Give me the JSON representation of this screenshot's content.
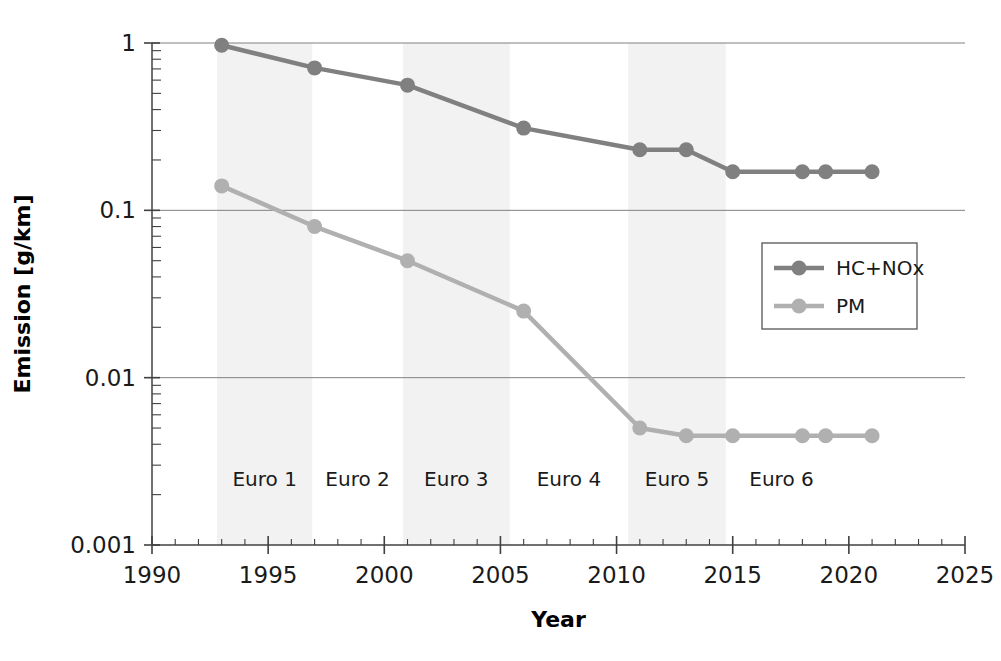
{
  "chart_data": {
    "type": "line",
    "title": "",
    "xlabel": "Year",
    "ylabel": "Emission [g/km]",
    "xlim": [
      1990,
      2025
    ],
    "ylim": [
      0.001,
      1
    ],
    "yscale": "log",
    "grid": true,
    "legend_position": "right",
    "x_ticks": [
      "1990",
      "1995",
      "2000",
      "2005",
      "2010",
      "2015",
      "2020",
      "2025"
    ],
    "x_tick_values": [
      1990,
      1995,
      2000,
      2005,
      2010,
      2015,
      2020,
      2025
    ],
    "y_ticks": [
      "1",
      "0.1",
      "0.01",
      "0.001"
    ],
    "y_tick_values": [
      1,
      0.1,
      0.01,
      0.001
    ],
    "series": [
      {
        "name": "HC+NOx",
        "color": "#808080",
        "x": [
          1993,
          1997,
          2001,
          2006,
          2011,
          2013,
          2015,
          2018,
          2019,
          2021
        ],
        "values": [
          0.97,
          0.71,
          0.56,
          0.31,
          0.23,
          0.23,
          0.17,
          0.17,
          0.17,
          0.17
        ]
      },
      {
        "name": "PM",
        "color": "#b0b0b0",
        "x": [
          1993,
          1997,
          2001,
          2006,
          2011,
          2013,
          2015,
          2018,
          2019,
          2021
        ],
        "values": [
          0.14,
          0.08,
          0.05,
          0.025,
          0.005,
          0.0045,
          0.0045,
          0.0045,
          0.0045,
          0.0045
        ]
      }
    ],
    "bands": [
      {
        "label": "Euro 1",
        "x_start": 1992.8,
        "x_end": 1996.9,
        "shaded": true
      },
      {
        "label": "Euro 2",
        "x_start": 1996.9,
        "x_end": 2000.8,
        "shaded": false
      },
      {
        "label": "Euro 3",
        "x_start": 2000.8,
        "x_end": 2005.4,
        "shaded": true
      },
      {
        "label": "Euro 4",
        "x_start": 2005.4,
        "x_end": 2010.5,
        "shaded": false
      },
      {
        "label": "Euro 5",
        "x_start": 2010.5,
        "x_end": 2014.7,
        "shaded": true
      },
      {
        "label": "Euro 6",
        "x_start": 2014.7,
        "x_end": 2019.5,
        "shaded": false
      }
    ],
    "band_shade_color": "#f2f2f2",
    "legend": [
      {
        "label": "HC+NOx",
        "color": "#808080"
      },
      {
        "label": "PM",
        "color": "#b0b0b0"
      }
    ]
  }
}
